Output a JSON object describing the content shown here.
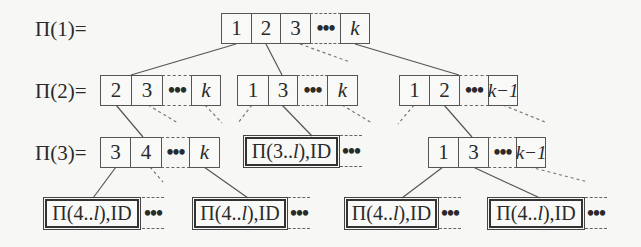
{
  "diagram": {
    "row_labels": [
      "Π(1)=",
      "Π(2)=",
      "Π(3)="
    ],
    "ellipsis": "•••",
    "level1": {
      "cells": [
        "1",
        "2",
        "3",
        "k"
      ]
    },
    "level2": {
      "groups": [
        {
          "cells": [
            "2",
            "3",
            "k"
          ]
        },
        {
          "cells": [
            "1",
            "3",
            "k"
          ]
        },
        {
          "cells": [
            "1",
            "2",
            "k−1"
          ]
        }
      ]
    },
    "level3": {
      "groups": [
        {
          "cells": [
            "3",
            "4",
            "k"
          ]
        },
        {
          "leaf": {
            "prefix": "Π(3.. ",
            "var": "l",
            "suffix": "),ID"
          }
        },
        {
          "cells": [
            "1",
            "3",
            "k−1"
          ]
        }
      ]
    },
    "level4": {
      "leaves": [
        {
          "prefix": "Π(4.. ",
          "var": "l",
          "suffix": "),ID"
        },
        {
          "prefix": "Π(4.. ",
          "var": "l",
          "suffix": "),ID"
        },
        {
          "prefix": "Π(4.. ",
          "var": "l",
          "suffix": "),ID"
        },
        {
          "prefix": "Π(4.. ",
          "var": "l",
          "suffix": "),ID"
        }
      ]
    },
    "colors": {
      "line": "#555555",
      "dashed": "#777777",
      "box_border": "#555555",
      "background": "#f7f7f5"
    }
  }
}
